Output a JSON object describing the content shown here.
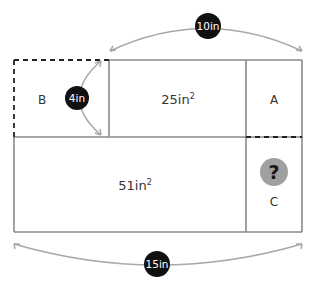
{
  "diagram": {
    "regions": {
      "b": {
        "label": "B"
      },
      "top_middle": {
        "area": "25in",
        "exp": "2"
      },
      "a": {
        "label": "A"
      },
      "bottom_left": {
        "area": "51in",
        "exp": "2"
      },
      "c": {
        "label": "C",
        "unknown_marker": "?"
      }
    },
    "dimensions": {
      "top_width": "10in",
      "left_height": "4in",
      "total_width": "15in"
    },
    "colors": {
      "line": "#8a8a8a",
      "arc": "#a8a8a8",
      "badge": "#111111",
      "question_badge": "#a0a0a0",
      "question_mark": "#1a1a1a",
      "text": "#333333"
    }
  }
}
